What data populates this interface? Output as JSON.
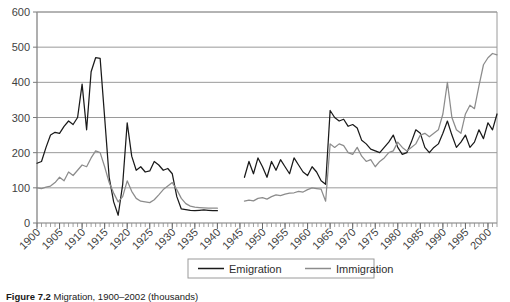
{
  "caption": {
    "label": "Figure 7.2",
    "text": "Migration, 1900–2002 (thousands)"
  },
  "legend": {
    "position": "bottom-center",
    "items": [
      {
        "label": "Emigration",
        "color": "#1a1a1a"
      },
      {
        "label": "Immigration",
        "color": "#8c8c8c"
      }
    ]
  },
  "axes": {
    "y_ticks": [
      "0",
      "100",
      "200",
      "300",
      "400",
      "500",
      "600"
    ],
    "x_ticks": [
      "1900",
      "1905",
      "1910",
      "1915",
      "1920",
      "1925",
      "1930",
      "1935",
      "1940",
      "1945",
      "1950",
      "1955",
      "1960",
      "1965",
      "1970",
      "1975",
      "1980",
      "1985",
      "1990",
      "1995",
      "2000"
    ]
  },
  "chart_data": {
    "type": "line",
    "title": "",
    "xlabel": "",
    "ylabel": "",
    "xlim": [
      1900,
      2002
    ],
    "ylim": [
      0,
      600
    ],
    "ytick_step": 100,
    "xtick_step": 5,
    "minor_xtick_step": 1,
    "grid": "horizontal",
    "legend_position": "bottom-center",
    "note": "Gap in both series between 1940 and 1945 (war years, no data).",
    "series": [
      {
        "name": "Emigration",
        "color": "#1a1a1a",
        "segments": [
          {
            "x": [
              1900,
              1901,
              1902,
              1903,
              1904,
              1905,
              1906,
              1907,
              1908,
              1909,
              1910,
              1911,
              1912,
              1913,
              1914,
              1915,
              1916,
              1917,
              1918,
              1919,
              1920,
              1921,
              1922,
              1923,
              1924,
              1925,
              1926,
              1927,
              1928,
              1929,
              1930,
              1931,
              1932,
              1933,
              1934,
              1935,
              1936,
              1937,
              1938,
              1939,
              1940
            ],
            "y": [
              170,
              175,
              215,
              250,
              258,
              255,
              275,
              290,
              280,
              300,
              395,
              265,
              430,
              470,
              468,
              300,
              130,
              60,
              22,
              110,
              285,
              190,
              150,
              160,
              145,
              148,
              175,
              165,
              150,
              155,
              140,
              75,
              40,
              38,
              36,
              35,
              36,
              37,
              36,
              35,
              35
            ]
          },
          {
            "x": [
              1946,
              1947,
              1948,
              1949,
              1950,
              1951,
              1952,
              1953,
              1954,
              1955,
              1956,
              1957,
              1958,
              1959,
              1960,
              1961,
              1962,
              1963,
              1964,
              1965,
              1966,
              1967,
              1968,
              1969,
              1970,
              1971,
              1972,
              1973,
              1974,
              1975,
              1976,
              1977,
              1978,
              1979,
              1980,
              1981,
              1982,
              1983,
              1984,
              1985,
              1986,
              1987,
              1988,
              1989,
              1990,
              1991,
              1992,
              1993,
              1994,
              1995,
              1996,
              1997,
              1998,
              1999,
              2000,
              2001,
              2002
            ],
            "y": [
              130,
              175,
              140,
              185,
              160,
              130,
              175,
              150,
              180,
              160,
              140,
              185,
              165,
              145,
              135,
              160,
              145,
              120,
              110,
              320,
              300,
              290,
              295,
              275,
              280,
              270,
              235,
              225,
              210,
              205,
              200,
              215,
              230,
              250,
              215,
              195,
              200,
              230,
              265,
              255,
              215,
              200,
              215,
              225,
              255,
              290,
              250,
              215,
              230,
              250,
              215,
              230,
              265,
              240,
              285,
              265,
              310
            ]
          }
        ]
      },
      {
        "name": "Immigration",
        "color": "#8c8c8c",
        "segments": [
          {
            "x": [
              1900,
              1901,
              1902,
              1903,
              1904,
              1905,
              1906,
              1907,
              1908,
              1909,
              1910,
              1911,
              1912,
              1913,
              1914,
              1915,
              1916,
              1917,
              1918,
              1919,
              1920,
              1921,
              1922,
              1923,
              1924,
              1925,
              1926,
              1927,
              1928,
              1929,
              1930,
              1931,
              1932,
              1933,
              1934,
              1935,
              1936,
              1937,
              1938,
              1939,
              1940
            ],
            "y": [
              100,
              98,
              102,
              105,
              115,
              130,
              120,
              145,
              135,
              150,
              165,
              160,
              185,
              205,
              200,
              160,
              115,
              85,
              60,
              75,
              120,
              90,
              70,
              62,
              60,
              58,
              66,
              80,
              95,
              105,
              115,
              95,
              70,
              55,
              48,
              45,
              44,
              43,
              42,
              42,
              42
            ]
          },
          {
            "x": [
              1946,
              1947,
              1948,
              1949,
              1950,
              1951,
              1952,
              1953,
              1954,
              1955,
              1956,
              1957,
              1958,
              1959,
              1960,
              1961,
              1962,
              1963,
              1964,
              1965,
              1966,
              1967,
              1968,
              1969,
              1970,
              1971,
              1972,
              1973,
              1974,
              1975,
              1976,
              1977,
              1978,
              1979,
              1980,
              1981,
              1982,
              1983,
              1984,
              1985,
              1986,
              1987,
              1988,
              1989,
              1990,
              1991,
              1992,
              1993,
              1994,
              1995,
              1996,
              1997,
              1998,
              1999,
              2000,
              2001,
              2002
            ],
            "y": [
              62,
              65,
              63,
              70,
              72,
              68,
              75,
              80,
              78,
              82,
              85,
              86,
              90,
              88,
              95,
              100,
              98,
              96,
              62,
              225,
              215,
              225,
              220,
              200,
              195,
              215,
              190,
              175,
              180,
              160,
              175,
              185,
              200,
              205,
              230,
              215,
              205,
              215,
              225,
              250,
              255,
              245,
              255,
              265,
              310,
              400,
              300,
              265,
              255,
              310,
              335,
              325,
              390,
              450,
              470,
              482,
              478
            ]
          }
        ]
      }
    ]
  }
}
